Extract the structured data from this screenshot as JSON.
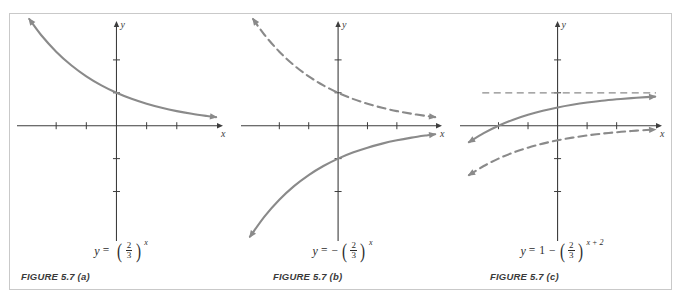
{
  "figure": {
    "colors": {
      "curve_solid": "#8a8a8a",
      "curve_dashed": "#8a8a8a",
      "axis": "#3d3d3d",
      "frame_border": "#c9c9c9",
      "background": "#ffffff",
      "text": "#2b2b2b",
      "caption_text": "#3a3a3a"
    },
    "panels": [
      {
        "id": "a",
        "caption": "FIGURE 5.7 (a)",
        "equation_text": "y = (2/3)^x",
        "equation": {
          "lhs": "y",
          "equals": "=",
          "sign": "",
          "leading": "",
          "numerator": "2",
          "denominator": "3",
          "exponent": "x"
        },
        "axis_labels": {
          "x": "x",
          "y": "y"
        }
      },
      {
        "id": "b",
        "caption": "FIGURE 5.7 (b)",
        "equation_text": "y = -(2/3)^x",
        "equation": {
          "lhs": "y",
          "equals": "=",
          "sign": "−",
          "leading": "",
          "numerator": "2",
          "denominator": "3",
          "exponent": "x"
        },
        "axis_labels": {
          "x": "x",
          "y": "y"
        }
      },
      {
        "id": "c",
        "caption": "FIGURE 5.7 (c)",
        "equation_text": "y = 1 - (2/3)^(x+2)",
        "equation": {
          "lhs": "y",
          "equals": "=",
          "sign": "−",
          "leading": "1",
          "numerator": "2",
          "denominator": "3",
          "exponent": "x + 2"
        },
        "axis_labels": {
          "x": "x",
          "y": "y"
        }
      }
    ]
  },
  "chart_data": [
    {
      "type": "line",
      "panel": "a",
      "title": "FIGURE 5.7 (a)",
      "xlabel": "x",
      "ylabel": "y",
      "xlim": [
        -3.1,
        3.4
      ],
      "ylim": [
        -3.2,
        3.0
      ],
      "grid": false,
      "xticks": [
        -2,
        -1,
        1,
        2
      ],
      "yticks": [
        -2,
        -1,
        1,
        2
      ],
      "series": [
        {
          "name": "y = (2/3)^x",
          "style": "solid",
          "color": "#8a8a8a",
          "x": [
            -3.0,
            -2.5,
            -2.0,
            -1.5,
            -1.0,
            -0.5,
            0.0,
            0.5,
            1.0,
            1.5,
            2.0,
            2.5,
            3.0,
            3.3
          ],
          "y": [
            3.375,
            2.756,
            2.25,
            1.837,
            1.5,
            1.225,
            1.0,
            0.816,
            0.667,
            0.544,
            0.444,
            0.363,
            0.296,
            0.26
          ]
        }
      ]
    },
    {
      "type": "line",
      "panel": "b",
      "title": "FIGURE 5.7 (b)",
      "xlabel": "x",
      "ylabel": "y",
      "xlim": [
        -3.1,
        3.4
      ],
      "ylim": [
        -3.2,
        3.0
      ],
      "grid": false,
      "xticks": [
        -2,
        -1,
        1,
        2
      ],
      "yticks": [
        -2,
        -1,
        1,
        2
      ],
      "series": [
        {
          "name": "y = (2/3)^x",
          "style": "dashed",
          "color": "#8a8a8a",
          "x": [
            -3.0,
            -2.5,
            -2.0,
            -1.5,
            -1.0,
            -0.5,
            0.0,
            0.5,
            1.0,
            1.5,
            2.0,
            2.5,
            3.0,
            3.3
          ],
          "y": [
            3.375,
            2.756,
            2.25,
            1.837,
            1.5,
            1.225,
            1.0,
            0.816,
            0.667,
            0.544,
            0.444,
            0.363,
            0.296,
            0.26
          ]
        },
        {
          "name": "y = -(2/3)^x",
          "style": "solid",
          "color": "#8a8a8a",
          "x": [
            -3.0,
            -2.5,
            -2.0,
            -1.5,
            -1.0,
            -0.5,
            0.0,
            0.5,
            1.0,
            1.5,
            2.0,
            2.5,
            3.0,
            3.3
          ],
          "y": [
            -3.375,
            -2.756,
            -2.25,
            -1.837,
            -1.5,
            -1.225,
            -1.0,
            -0.816,
            -0.667,
            -0.544,
            -0.444,
            -0.363,
            -0.296,
            -0.26
          ]
        }
      ]
    },
    {
      "type": "line",
      "panel": "c",
      "title": "FIGURE 5.7 (c)",
      "xlabel": "x",
      "ylabel": "y",
      "xlim": [
        -3.1,
        3.4
      ],
      "ylim": [
        -3.2,
        3.0
      ],
      "grid": false,
      "xticks": [
        -2,
        -1,
        1,
        2
      ],
      "yticks": [
        -2,
        -1,
        1,
        2
      ],
      "asymptote": {
        "type": "horizontal",
        "y": 1,
        "style": "dashed",
        "color": "#8a8a8a"
      },
      "series": [
        {
          "name": "y = 1 - (2/3)^(x+2)",
          "style": "solid",
          "color": "#8a8a8a",
          "x": [
            -3.0,
            -2.5,
            -2.0,
            -1.5,
            -1.0,
            -0.5,
            0.0,
            0.5,
            1.0,
            1.5,
            2.0,
            2.5,
            3.0,
            3.3
          ],
          "y": [
            -0.5,
            -0.225,
            0.0,
            0.184,
            0.333,
            0.456,
            0.556,
            0.637,
            0.704,
            0.758,
            0.802,
            0.839,
            0.868,
            0.883
          ],
          "x_intercept": -2
        },
        {
          "name": "y = -(2/3)^(x+2)",
          "style": "dashed",
          "color": "#8a8a8a",
          "x": [
            -3.0,
            -2.5,
            -2.0,
            -1.5,
            -1.0,
            -0.5,
            0.0,
            0.5,
            1.0,
            1.5,
            2.0,
            2.5,
            3.0,
            3.3
          ],
          "y": [
            -1.5,
            -1.225,
            -1.0,
            -0.816,
            -0.667,
            -0.544,
            -0.444,
            -0.363,
            -0.296,
            -0.242,
            -0.198,
            -0.161,
            -0.132,
            -0.117
          ]
        }
      ]
    }
  ]
}
